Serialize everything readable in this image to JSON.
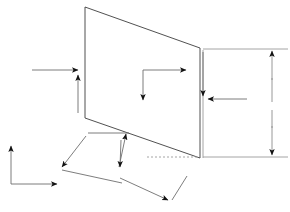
{
  "document": {
    "title": "Technical line drawing",
    "description": "Engineering-style wireframe of a tilted quadrilateral panel with dimension arrows and coordinate axis indicators",
    "canvas": {
      "width": 290,
      "height": 212,
      "background": "#ffffff"
    }
  },
  "colors": {
    "shape_stroke": "#3d3d3d",
    "dimension_stroke": "#8c8c8c",
    "arrow_stroke": "#6e6e6e",
    "arrow_head_fill": "#111111",
    "hidden_stroke": "#9a9a9a",
    "background": "#ffffff"
  },
  "geometry": {
    "panel": {
      "name": "main-quadrilateral",
      "points": "85,7 200,48 200,158 85,118",
      "closed": true
    },
    "hidden_edge": {
      "name": "hidden-baseline",
      "x1": 147,
      "y1": 157,
      "x2": 199,
      "y2": 157
    },
    "right_upper_extension": {
      "x1": 203,
      "y1": 49,
      "x2": 288,
      "y2": 49
    },
    "right_lower_extension": {
      "x1": 203,
      "y1": 157,
      "x2": 288,
      "y2": 157
    },
    "right_dimension_stem_upper": {
      "x1": 272,
      "y1": 50,
      "x2": 272,
      "y2": 100
    },
    "right_dimension_stem_lower": {
      "x1": 272,
      "y1": 108,
      "x2": 272,
      "y2": 155
    },
    "inner_vertical_ext": {
      "x1": 203,
      "y1": 50,
      "x2": 203,
      "y2": 158
    }
  },
  "annotations": {
    "left_horizontal_arrow": {
      "label": "left-horizontal-arrow",
      "direction": "right",
      "from": {
        "x": 32,
        "y": 70
      },
      "to": {
        "x": 78,
        "y": 70
      }
    },
    "left_vertical_arrow": {
      "label": "left-vertical-arrow",
      "direction": "up",
      "from": {
        "x": 78,
        "y": 113
      },
      "to": {
        "x": 78,
        "y": 75
      }
    },
    "inner_axis_horizontal": {
      "label": "inner-axis-horizontal-arrow",
      "direction": "right",
      "from": {
        "x": 143,
        "y": 70
      },
      "to": {
        "x": 186,
        "y": 70
      }
    },
    "inner_axis_vertical": {
      "label": "inner-axis-vertical-arrow",
      "direction": "down",
      "from": {
        "x": 143,
        "y": 70
      },
      "to": {
        "x": 143,
        "y": 100
      }
    },
    "right_inner_horizontal_arrow": {
      "label": "right-inner-horizontal-arrow",
      "direction": "left",
      "from": {
        "x": 247,
        "y": 99
      },
      "to": {
        "x": 208,
        "y": 99
      }
    },
    "right_inner_vertical_arrow": {
      "label": "right-inner-vertical-arrow",
      "direction": "down",
      "from": {
        "x": 203,
        "y": 52
      },
      "to": {
        "x": 203,
        "y": 96
      }
    },
    "right_dimension_arrow_top": {
      "label": "right-dimension-arrow-top",
      "direction": "up",
      "from": {
        "x": 272,
        "y": 78
      },
      "to": {
        "x": 272,
        "y": 51
      }
    },
    "right_dimension_arrow_bottom": {
      "label": "right-dimension-arrow-bottom",
      "direction": "down",
      "from": {
        "x": 272,
        "y": 126
      },
      "to": {
        "x": 272,
        "y": 155
      }
    },
    "bottom_left_axis_vertical": {
      "label": "bottom-left-axis-vertical-arrow",
      "direction": "up",
      "from": {
        "x": 11,
        "y": 184
      },
      "to": {
        "x": 11,
        "y": 146
      }
    },
    "bottom_left_axis_horizontal": {
      "label": "bottom-left-axis-horizontal-arrow",
      "direction": "right",
      "from": {
        "x": 11,
        "y": 184
      },
      "to": {
        "x": 57,
        "y": 184
      }
    },
    "bracket_left_arm": {
      "label": "bracket-left-arm-arrow",
      "direction": "down-left",
      "from": {
        "x": 86,
        "y": 136
      },
      "to": {
        "x": 62,
        "y": 167
      }
    },
    "bracket_bottom_arm": {
      "label": "bracket-bottom-arm",
      "from": {
        "x": 62,
        "y": 170
      },
      "to": {
        "x": 122,
        "y": 183
      }
    },
    "bracket_right_up_arrow": {
      "label": "bracket-right-up-arrow",
      "direction": "up-right",
      "from": {
        "x": 119,
        "y": 167
      },
      "to": {
        "x": 126,
        "y": 134
      }
    },
    "bracket_top_arm": {
      "label": "bracket-top-arm",
      "from": {
        "x": 88,
        "y": 133
      },
      "to": {
        "x": 129,
        "y": 133
      }
    },
    "bracket_right_down_arrow": {
      "label": "bracket-right-down-arrow",
      "direction": "down",
      "from": {
        "x": 121,
        "y": 140
      },
      "to": {
        "x": 120,
        "y": 167
      }
    },
    "lower_vee_left_arm": {
      "label": "lower-vee-left-arm",
      "from": {
        "x": 120,
        "y": 178
      },
      "to": {
        "x": 168,
        "y": 200
      }
    },
    "lower_vee_right_arm": {
      "label": "lower-vee-right-arm",
      "from": {
        "x": 187,
        "y": 176
      },
      "to": {
        "x": 172,
        "y": 200
      }
    },
    "lower_vee_vertex_arrow": {
      "label": "lower-vee-vertex-arrow",
      "direction": "down-right",
      "vertex": {
        "x": 170,
        "y": 202
      }
    },
    "upper_bracket_vee_vertex": {
      "label": "upper-bracket-vee-vertex-arrow",
      "direction": "up-right",
      "vertex": {
        "x": 126,
        "y": 134
      }
    }
  },
  "labels": {
    "panel_name": "",
    "dimension_text": "",
    "axis_x": "",
    "axis_y": ""
  }
}
